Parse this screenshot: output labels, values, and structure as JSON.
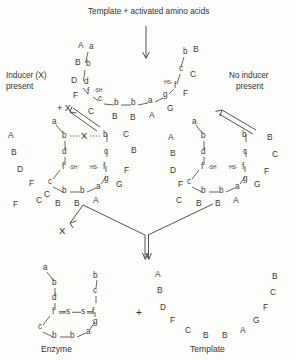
{
  "diagram": {
    "title": "Template + activated amino acids",
    "branch_left_label": "Inducer (X)\npresent",
    "branch_left_line1": "Inducer (X)",
    "branch_left_line2": "present",
    "branch_right_line1": "No inducer",
    "branch_right_line2": "present",
    "plus_x_label": "+ X",
    "released_x_label": "X",
    "plus_sign": "+",
    "product_left_label": "Enzyme",
    "product_right_label": "Template",
    "thiol_left": "-SH",
    "thiol_right": "HS-",
    "sulfur": "s"
  },
  "top_chain": {
    "left_arm_caps": [
      "A",
      "B",
      "D",
      "F"
    ],
    "left_arm_lows": [
      "a",
      "b",
      "d",
      "f"
    ],
    "bottom_caps": [
      "C",
      "B",
      "B",
      "A",
      "G"
    ],
    "bottom_lows": [
      "c",
      "b",
      "b",
      "a",
      "g"
    ],
    "right_arm_caps": [
      "F",
      "C",
      "B"
    ],
    "right_arm_lows": [
      "f",
      "c",
      "b"
    ]
  },
  "folded_left": {
    "lows_top": [
      "a",
      "b",
      "d",
      "b",
      "c"
    ],
    "lows_core": [
      "f",
      "f"
    ],
    "lows_bottom": [
      "c",
      "b",
      "b",
      "a",
      "g"
    ],
    "bound_inducer": "X",
    "outer_caps_left": [
      "A",
      "B",
      "D",
      "F",
      "C"
    ],
    "outer_caps_bottom": [
      "C",
      "B",
      "B",
      "A"
    ],
    "outer_caps_right": [
      "C",
      "B",
      "F",
      "G"
    ]
  },
  "folded_right": {
    "lows_top": [
      "a",
      "b",
      "d",
      "b",
      "c"
    ],
    "lows_core": [
      "f",
      "f"
    ],
    "lows_bottom": [
      "c",
      "b",
      "b",
      "a",
      "g"
    ],
    "outer_caps_left": [
      "A",
      "B",
      "D",
      "F",
      "C"
    ],
    "outer_caps_bottom": [
      "C",
      "B",
      "B",
      "A"
    ],
    "outer_caps_right": [
      "B",
      "C",
      "F",
      "G"
    ]
  },
  "enzyme": {
    "lows_top": [
      "a",
      "b",
      "d",
      "b",
      "c"
    ],
    "lows_core": [
      "f",
      "f"
    ],
    "lows_bottom": [
      "c",
      "b",
      "b",
      "a",
      "g"
    ]
  },
  "template": {
    "left_arm": [
      "A",
      "B",
      "D",
      "F"
    ],
    "bottom": [
      "C",
      "B",
      "B",
      "A",
      "G"
    ],
    "right_arm": [
      "F",
      "C",
      "B"
    ]
  },
  "scatter": {
    "mid_left": [
      "A",
      "B",
      "D",
      "F",
      "C"
    ],
    "mid_right": [
      "B",
      "C",
      "F",
      "G",
      "B",
      "A"
    ]
  }
}
